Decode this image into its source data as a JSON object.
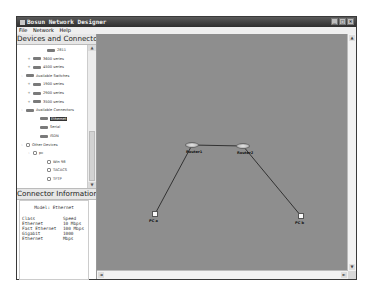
{
  "window": {
    "title": "Bosun Network Designer",
    "controls": [
      "minimize",
      "maximize",
      "close"
    ]
  },
  "menu": [
    "File",
    "Network",
    "Help"
  ],
  "devices_panel": {
    "title": "Devices and Connectors",
    "tree": [
      {
        "level": 3,
        "expander": "",
        "icon": "router-icon",
        "label": "2811"
      },
      {
        "level": 1,
        "expander": "+",
        "icon": "router-icon",
        "label": "3600 series"
      },
      {
        "level": 1,
        "expander": "+",
        "icon": "router-icon",
        "label": "4500 series"
      },
      {
        "level": 0,
        "expander": "-",
        "icon": "switch-icon",
        "label": "Available Switches"
      },
      {
        "level": 1,
        "expander": "+",
        "icon": "switch-icon",
        "label": "1900 series"
      },
      {
        "level": 1,
        "expander": "+",
        "icon": "switch-icon",
        "label": "2900 series"
      },
      {
        "level": 1,
        "expander": "+",
        "icon": "switch-icon",
        "label": "3500 series"
      },
      {
        "level": 0,
        "expander": "-",
        "icon": "connector-icon",
        "label": "Available Connectors"
      },
      {
        "level": 2,
        "expander": "",
        "icon": "connector-icon",
        "label": "Ethernet",
        "selected": true
      },
      {
        "level": 2,
        "expander": "",
        "icon": "connector-icon",
        "label": "Serial"
      },
      {
        "level": 2,
        "expander": "",
        "icon": "connector-icon",
        "label": "ISDN"
      },
      {
        "level": 0,
        "expander": "-",
        "icon": "folder-icon",
        "label": "Other Devices"
      },
      {
        "level": 1,
        "expander": "-",
        "icon": "folder-icon",
        "label": "pc"
      },
      {
        "level": 3,
        "expander": "",
        "icon": "document-icon",
        "label": "Win 98"
      },
      {
        "level": 3,
        "expander": "",
        "icon": "document-icon",
        "label": "TACACS"
      },
      {
        "level": 3,
        "expander": "",
        "icon": "document-icon",
        "label": "TFTP"
      }
    ]
  },
  "connector_panel": {
    "title": "Connector Information",
    "model": "Model: Ethernet",
    "headers": [
      "Class",
      "Speed"
    ],
    "rows": [
      [
        "Ethernet",
        "10 Mbps"
      ],
      [
        "Fast Ethernet",
        "100 Mbps"
      ],
      [
        "Gigabit Ethernet",
        "1000 Mbps"
      ]
    ]
  },
  "canvas": {
    "background": "#8e8e8e",
    "devices": [
      {
        "id": "router1",
        "type": "router",
        "label": "Router1",
        "x": 95,
        "y": 111
      },
      {
        "id": "router2",
        "type": "router",
        "label": "Router2",
        "x": 146,
        "y": 112
      },
      {
        "id": "pcA",
        "type": "pc",
        "label": "PC a",
        "x": 58,
        "y": 180
      },
      {
        "id": "pcB",
        "type": "pc",
        "label": "PC b",
        "x": 204,
        "y": 182
      }
    ],
    "links": [
      {
        "from": "router1",
        "to": "router2"
      },
      {
        "from": "router1",
        "to": "pcA"
      },
      {
        "from": "router2",
        "to": "pcB"
      }
    ]
  }
}
